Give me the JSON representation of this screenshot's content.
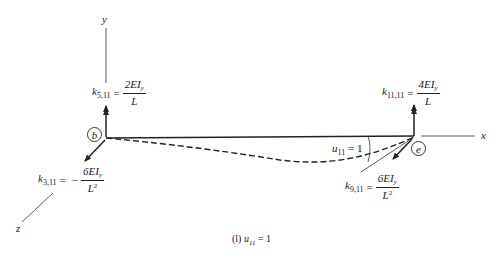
{
  "figure": {
    "caption_prefix": "(l)",
    "caption_var": "u",
    "caption_sub": "11",
    "caption_rest": "= 1"
  },
  "axes": {
    "x_label": "x",
    "y_label": "y",
    "z_label": "z"
  },
  "nodes": {
    "start": "b",
    "end": "e"
  },
  "rotation_label": {
    "var": "u",
    "sub": "11",
    "rest": "= 1"
  },
  "coefficients": {
    "k5": {
      "symbol": "k",
      "sub": "5,11",
      "sign": "",
      "numerator": "2EI",
      "num_sub": "y",
      "denominator": "L",
      "den_sup": ""
    },
    "k11": {
      "symbol": "k",
      "sub": "11,11",
      "sign": "",
      "numerator": "4EI",
      "num_sub": "y",
      "denominator": "L",
      "den_sup": ""
    },
    "k3": {
      "symbol": "k",
      "sub": "3,11",
      "sign": "−",
      "numerator": "6EI",
      "num_sub": "y",
      "denominator": "L",
      "den_sup": "2"
    },
    "k9": {
      "symbol": "k",
      "sub": "9,11",
      "sign": "",
      "numerator": "6EI",
      "num_sub": "y",
      "denominator": "L",
      "den_sup": "2"
    }
  },
  "colors": {
    "line": "#222222",
    "background": "#ffffff"
  }
}
